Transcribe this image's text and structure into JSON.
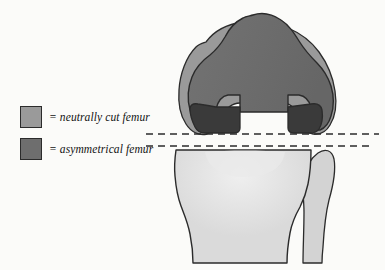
{
  "figure": {
    "background_color": "#fbfbf9"
  },
  "legend": {
    "items": [
      {
        "swatch_color": "#9a9a9a",
        "swatch_border": "#2b2b2b",
        "equals_sign": "=",
        "label": "= neutrally cut femur",
        "text": "neutrally cut femur"
      },
      {
        "swatch_color": "#6e6e6e",
        "swatch_border": "#2b2b2b",
        "equals_sign": "=",
        "label": "= asymmetrical femur",
        "text": "asymmetrical femur"
      }
    ]
  },
  "anatomy": {
    "neutral_femur": {
      "name": "neutrally cut femur",
      "fill": "#9a9a9a",
      "stroke": "#2b2b2b"
    },
    "asymmetrical_femur": {
      "name": "asymmetrical femur",
      "fill": "#6e6e6e",
      "stroke": "#2b2b2b"
    },
    "condyles": {
      "name": "posterior condyles",
      "fill": "#3a3a3a",
      "stroke": "#2b2b2b",
      "count": 2
    },
    "tibia": {
      "name": "tibial plateau",
      "fill": "#dddddd",
      "stroke": "#2b2b2b"
    },
    "fibula": {
      "name": "fibula head",
      "fill": "#d3d3d3",
      "stroke": "#2b2b2b"
    }
  },
  "guide_lines": {
    "stroke": "#2b2b2b",
    "dash": "7 5",
    "lines": [
      {
        "name": "upper-resection-line",
        "y": 134,
        "x1": 146,
        "x2": 379
      },
      {
        "name": "lower-resection-line",
        "y": 146,
        "x1": 146,
        "x2": 369
      }
    ]
  }
}
